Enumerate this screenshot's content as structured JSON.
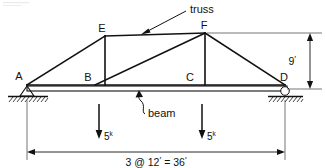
{
  "figure": {
    "background_color": "#ffffff",
    "line_color": "#111111"
  },
  "nodes": [
    {
      "id": "A",
      "label": "A",
      "x": 27,
      "y": 85,
      "label_x": 19,
      "label_y": 79,
      "support": "pin"
    },
    {
      "id": "B",
      "label": "B",
      "x": 95,
      "y": 85,
      "label_x": 87,
      "label_y": 80,
      "support": "none"
    },
    {
      "id": "C",
      "label": "C",
      "x": 196,
      "y": 85,
      "label_x": 189,
      "label_y": 80,
      "support": "none"
    },
    {
      "id": "D",
      "label": "D",
      "x": 285,
      "y": 85,
      "label_x": 281,
      "label_y": 80,
      "support": "roller"
    },
    {
      "id": "E",
      "label": "E",
      "x": 105,
      "y": 36,
      "label_x": 100,
      "label_y": 31,
      "support": "none"
    },
    {
      "id": "F",
      "label": "F",
      "x": 205,
      "y": 33,
      "label_x": 202,
      "label_y": 28,
      "support": "none"
    }
  ],
  "members": [
    {
      "name": "top-chord-A-E",
      "from": "A",
      "to": "E"
    },
    {
      "name": "top-chord-E-F",
      "from": "E",
      "to": "F"
    },
    {
      "name": "top-chord-F-D",
      "from": "F",
      "to": "D"
    },
    {
      "name": "vertical-E-B",
      "from": "E",
      "to": "B"
    },
    {
      "name": "vertical-F-C",
      "from": "F",
      "to": "C"
    },
    {
      "name": "diagonal-B-F",
      "from": "B",
      "to": "F"
    },
    {
      "name": "bottom-chord-A-D",
      "from": "A",
      "to": "D"
    }
  ],
  "annotations": [
    {
      "id": "truss",
      "label": "truss",
      "label_x": 189,
      "label_y": 12,
      "leader_from_x": 186,
      "leader_from_y": 10,
      "leader_to_x": 142,
      "leader_to_y": 34,
      "arrow": "end"
    },
    {
      "id": "beam",
      "label": "beam",
      "label_x": 147,
      "label_y": 113,
      "leader_from_x": 144,
      "leader_from_y": 109,
      "leader_to_x": 138,
      "leader_to_y": 92,
      "arrow": "end"
    }
  ],
  "loads": [
    {
      "id": "load-at-B",
      "magnitude": "5",
      "unit_superscript": "k",
      "x": 99,
      "top_y": 103,
      "bottom_y": 138,
      "label_x": 104,
      "label_y": 139,
      "direction": "down"
    },
    {
      "id": "load-at-C",
      "magnitude": "5",
      "unit_superscript": "k",
      "x": 202,
      "top_y": 103,
      "bottom_y": 138,
      "label_x": 207,
      "label_y": 139,
      "direction": "down"
    }
  ],
  "dimensions": [
    {
      "id": "span-dimension",
      "text": "3 @ 12",
      "text_mid": "= 36",
      "full_text": "3 @ 12' = 36'",
      "orientation": "horizontal",
      "from_x": 27,
      "to_x": 285,
      "y": 152,
      "label_x": 163,
      "label_y": 165
    },
    {
      "id": "height-dimension",
      "text": "9",
      "full_text": "9'",
      "orientation": "vertical",
      "x": 310,
      "from_y": 33,
      "to_y": 89,
      "label_x": 297,
      "label_y": 64
    }
  ],
  "supports": {
    "pin": {
      "id": "pin-support-A",
      "node": "A",
      "ground_y": 96,
      "ground_x1": 8,
      "ground_x2": 48
    },
    "roller": {
      "id": "roller-support-D",
      "node": "D",
      "ground_y": 96,
      "ground_x1": 268,
      "ground_x2": 303
    }
  },
  "beam": {
    "id": "beam-element",
    "x1": 27,
    "x2": 287,
    "top_y": 86,
    "bottom_y": 91
  }
}
